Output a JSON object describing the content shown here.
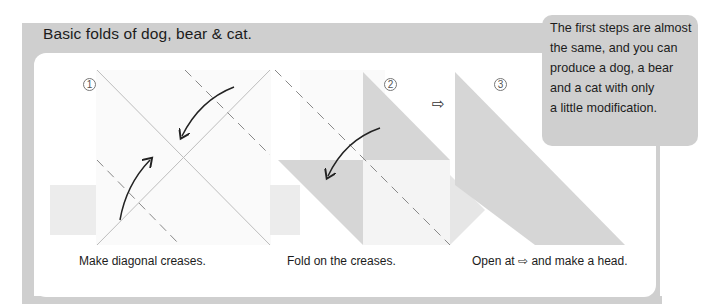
{
  "title": "Basic folds of dog, bear & cat.",
  "callout": {
    "lines": [
      "The first steps are almost",
      "the same, and you can",
      "produce a dog, a bear",
      "and a cat with only",
      "a little modification."
    ]
  },
  "steps": [
    {
      "number": "1",
      "caption": "Make diagonal creases."
    },
    {
      "number": "2",
      "caption": "Fold on the creases."
    },
    {
      "number": "3",
      "caption": "Open at ⇨ and make a head."
    }
  ],
  "between_arrow_glyph": "⇨",
  "colors": {
    "frame": "#cfcfcf",
    "paper_shade": "#d6d6d6",
    "paper_light": "#ececec",
    "crease_line": "#b8b8b8",
    "fold_arrow": "#222222"
  }
}
